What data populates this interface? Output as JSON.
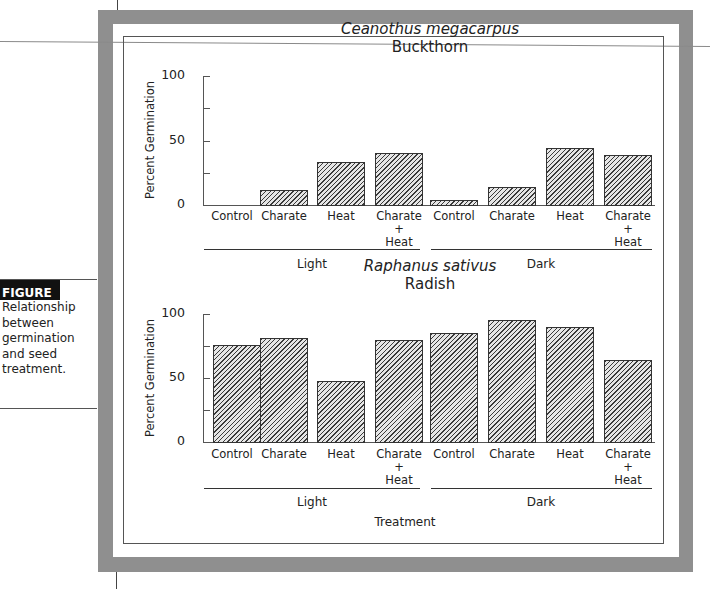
{
  "caption": {
    "label": "FIGURE 1.",
    "text": [
      "Relationship",
      "between",
      "germination",
      "and seed",
      "treatment."
    ]
  },
  "x_axis_title": "Treatment",
  "chart_data": [
    {
      "type": "bar",
      "title": "Ceanothus megacarpus",
      "subtitle": "Buckthorn",
      "ylabel": "Percent Germination",
      "xlabel": "",
      "ylim": [
        0,
        100
      ],
      "yticks": [
        0,
        25,
        50,
        75,
        100
      ],
      "ytick_labels": [
        "0",
        "50",
        "100"
      ],
      "groups": [
        "Light",
        "Dark"
      ],
      "categories": [
        "Control",
        "Charate",
        "Heat",
        "Charate + Heat",
        "Control",
        "Charate",
        "Heat",
        "Charate + Heat"
      ],
      "category_labels": [
        [
          "Control"
        ],
        [
          "Charate"
        ],
        [
          "Heat"
        ],
        [
          "Charate",
          "+",
          "Heat"
        ],
        [
          "Control"
        ],
        [
          "Charate"
        ],
        [
          "Heat"
        ],
        [
          "Charate",
          "+",
          "Heat"
        ]
      ],
      "series": [
        {
          "name": "Light",
          "categories": [
            "Control",
            "Charate",
            "Heat",
            "Charate + Heat"
          ],
          "values": [
            0,
            12,
            33,
            40
          ]
        },
        {
          "name": "Dark",
          "categories": [
            "Control",
            "Charate",
            "Heat",
            "Charate + Heat"
          ],
          "values": [
            4,
            14,
            44,
            39
          ]
        }
      ],
      "values": [
        0,
        12,
        33,
        40,
        4,
        14,
        44,
        39
      ],
      "grid": false,
      "legend": "none"
    },
    {
      "type": "bar",
      "title": "Raphanus sativus",
      "subtitle": "Radish",
      "ylabel": "Percent Germination",
      "xlabel": "Treatment",
      "ylim": [
        0,
        100
      ],
      "yticks": [
        0,
        25,
        50,
        75,
        100
      ],
      "ytick_labels": [
        "0",
        "50",
        "100"
      ],
      "groups": [
        "Light",
        "Dark"
      ],
      "categories": [
        "Control",
        "Charate",
        "Heat",
        "Charate + Heat",
        "Control",
        "Charate",
        "Heat",
        "Charate + Heat"
      ],
      "category_labels": [
        [
          "Control"
        ],
        [
          "Charate"
        ],
        [
          "Heat"
        ],
        [
          "Charate",
          "+",
          "Heat"
        ],
        [
          "Control"
        ],
        [
          "Charate"
        ],
        [
          "Heat"
        ],
        [
          "Charate",
          "+",
          "Heat"
        ]
      ],
      "series": [
        {
          "name": "Light",
          "categories": [
            "Control",
            "Charate",
            "Heat",
            "Charate + Heat"
          ],
          "values": [
            76,
            81,
            48,
            80
          ]
        },
        {
          "name": "Dark",
          "categories": [
            "Control",
            "Charate",
            "Heat",
            "Charate + Heat"
          ],
          "values": [
            85,
            95,
            90,
            64
          ]
        }
      ],
      "values": [
        76,
        81,
        48,
        80,
        85,
        95,
        90,
        64
      ],
      "grid": false,
      "legend": "none"
    }
  ],
  "colors": {
    "frame": "#8f8f8f",
    "caption_label_bg": "#111111",
    "bar_hatch": "#3a3a3a",
    "bar_fill": "#e6e6e6"
  }
}
